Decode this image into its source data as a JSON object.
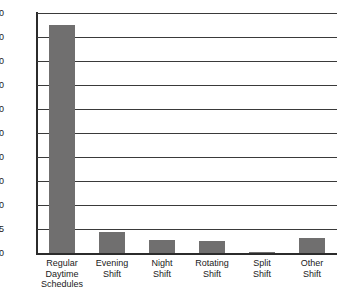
{
  "chart_data": {
    "type": "bar",
    "title": "",
    "subtitle": "",
    "xlabel": "",
    "ylabel": "",
    "categories": [
      "Regular Daytime\nSchedules",
      "Evening\nShift",
      "Night\nShift",
      "Rotating\nShift",
      "Split\nShift",
      "Other\nShift"
    ],
    "values": [
      85,
      4.3,
      2.8,
      2.4,
      0.2,
      3.1
    ],
    "ytick_labels": [
      "0",
      "5",
      "10",
      "20",
      "30",
      "40",
      "50",
      "60",
      "70",
      "80",
      "90"
    ],
    "ytick_values": [
      0,
      5,
      10,
      20,
      30,
      40,
      50,
      60,
      70,
      80,
      90
    ],
    "ylim": [
      0,
      90
    ],
    "grid": true,
    "legend": "none",
    "bar_color": "#706f6f",
    "axis_color": "#2b2b2b",
    "grid_color": "#3a3a3a",
    "background_color": "#ffffff"
  }
}
